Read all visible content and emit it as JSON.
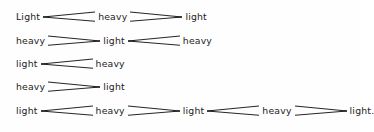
{
  "figure": {
    "background_color": "#fefefe",
    "text_color": "#1c1c1c",
    "line_color": "#262626",
    "lines": [
      {
        "id": "line-1",
        "tokens": [
          {
            "type": "node",
            "text": "Light"
          },
          {
            "type": "arrow",
            "direction": "left"
          },
          {
            "type": "node",
            "text": "heavy"
          },
          {
            "type": "arrow",
            "direction": "right"
          },
          {
            "type": "node",
            "text": "light"
          }
        ]
      },
      {
        "id": "line-2",
        "tokens": [
          {
            "type": "node",
            "text": "heavy"
          },
          {
            "type": "arrow",
            "direction": "right"
          },
          {
            "type": "node",
            "text": "light"
          },
          {
            "type": "arrow",
            "direction": "left"
          },
          {
            "type": "node",
            "text": "heavy"
          }
        ]
      },
      {
        "id": "line-3",
        "tokens": [
          {
            "type": "node",
            "text": "light"
          },
          {
            "type": "arrow",
            "direction": "left"
          },
          {
            "type": "node",
            "text": "heavy"
          }
        ]
      },
      {
        "id": "line-4",
        "tokens": [
          {
            "type": "node",
            "text": "heavy"
          },
          {
            "type": "arrow",
            "direction": "right"
          },
          {
            "type": "node",
            "text": "light"
          }
        ]
      },
      {
        "id": "line-5",
        "tokens": [
          {
            "type": "node",
            "text": "light"
          },
          {
            "type": "arrow",
            "direction": "left"
          },
          {
            "type": "node",
            "text": "heavy"
          },
          {
            "type": "arrow",
            "direction": "right"
          },
          {
            "type": "node",
            "text": "light"
          },
          {
            "type": "arrow",
            "direction": "left"
          },
          {
            "type": "node",
            "text": "heavy"
          },
          {
            "type": "arrow",
            "direction": "right"
          },
          {
            "type": "node",
            "text": "light."
          }
        ]
      }
    ]
  }
}
